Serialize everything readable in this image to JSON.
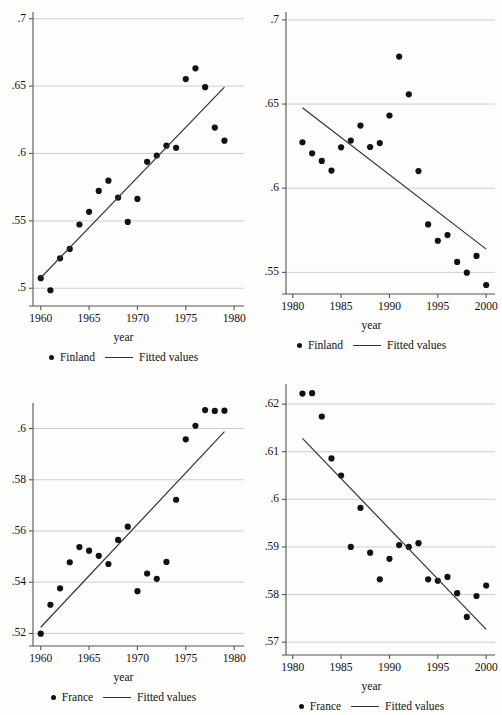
{
  "figure": {
    "background": "#fdfdfb",
    "marker_color": "#111111",
    "line_color": "#333333",
    "grid_color": "#c8c8c8",
    "axis_color": "#555555"
  },
  "panels": [
    {
      "id": "finland-1960-1979",
      "position": {
        "left": 0,
        "top": 0
      },
      "legend": {
        "series_label": "Finland",
        "fit_label": "Fitted values"
      },
      "chart_data": {
        "type": "scatter",
        "title": "",
        "xlabel": "year",
        "ylabel": "",
        "xlim": [
          1959.2,
          1980.4
        ],
        "ylim": [
          0.4935,
          0.7035
        ],
        "xticks": [
          1960,
          1965,
          1970,
          1975,
          1980
        ],
        "xticklabels": [
          "1960",
          "1965",
          "1970",
          "1975",
          "1980"
        ],
        "yticks": [
          0.5,
          0.55,
          0.6,
          0.65,
          0.7
        ],
        "yticklabels": [
          ".5",
          ".55",
          ".6",
          ".65",
          ".7"
        ],
        "grid": true,
        "legend_position": "below",
        "series": [
          {
            "name": "Finland",
            "kind": "scatter",
            "x": [
              1960,
              1961,
              1962,
              1963,
              1964,
              1965,
              1966,
              1967,
              1968,
              1969,
              1970,
              1971,
              1972,
              1973,
              1974,
              1975,
              1976,
              1977,
              1978,
              1979
            ],
            "y": [
              0.5075,
              0.4985,
              0.5222,
              0.5292,
              0.5473,
              0.5567,
              0.5722,
              0.5798,
              0.5673,
              0.5492,
              0.5663,
              0.5938,
              0.5985,
              0.6058,
              0.6042,
              0.6552,
              0.6632,
              0.6492,
              0.6192,
              0.6095
            ]
          },
          {
            "name": "Fitted values",
            "kind": "line",
            "x": [
              1960,
              1979
            ],
            "y": [
              0.5078,
              0.6492
            ]
          }
        ]
      }
    },
    {
      "id": "finland-1981-2000",
      "position": {
        "left": 248,
        "top": 0
      },
      "legend": {
        "series_label": "Finland",
        "fit_label": "Fitted values"
      },
      "chart_data": {
        "type": "scatter",
        "title": "",
        "xlabel": "year",
        "ylabel": "",
        "xlim": [
          1979.3,
          2000.5
        ],
        "ylim": [
          0.5425,
          0.7035
        ],
        "xticks": [
          1980,
          1985,
          1990,
          1995,
          2000
        ],
        "xticklabels": [
          "1980",
          "1985",
          "1990",
          "1995",
          "2000"
        ],
        "yticks": [
          0.55,
          0.6,
          0.65,
          0.7
        ],
        "yticklabels": [
          ".55",
          ".6",
          ".65",
          ".7"
        ],
        "grid": true,
        "legend_position": "below",
        "series": [
          {
            "name": "Finland",
            "kind": "scatter",
            "x": [
              1981,
              1982,
              1983,
              1984,
              1985,
              1986,
              1987,
              1988,
              1989,
              1990,
              1991,
              1992,
              1993,
              1994,
              1995,
              1996,
              1997,
              1998,
              1999,
              2000
            ],
            "y": [
              0.6273,
              0.6207,
              0.6162,
              0.6105,
              0.6243,
              0.6283,
              0.6372,
              0.6245,
              0.6268,
              0.6432,
              0.6782,
              0.6558,
              0.6102,
              0.5785,
              0.5688,
              0.5722,
              0.5562,
              0.5498,
              0.5598,
              0.5425
            ]
          },
          {
            "name": "Fitted values",
            "kind": "line",
            "x": [
              1981,
              2000
            ],
            "y": [
              0.6478,
              0.5638
            ]
          }
        ]
      }
    },
    {
      "id": "france-1960-1979",
      "position": {
        "left": 0,
        "top": 357
      },
      "legend": {
        "series_label": "France",
        "fit_label": "Fitted values"
      },
      "chart_data": {
        "type": "scatter",
        "title": "",
        "xlabel": "year",
        "ylabel": "",
        "xlim": [
          1959.2,
          1980.4
        ],
        "ylim": [
          0.5186,
          0.6092
        ],
        "xticks": [
          1960,
          1965,
          1970,
          1975,
          1980
        ],
        "xticklabels": [
          "1960",
          "1965",
          "1970",
          "1975",
          "1980"
        ],
        "yticks": [
          0.52,
          0.54,
          0.56,
          0.58,
          0.6
        ],
        "yticklabels": [
          ".52",
          ".54",
          ".56",
          ".58",
          ".6"
        ],
        "grid": true,
        "legend_position": "below",
        "series": [
          {
            "name": "France",
            "kind": "scatter",
            "x": [
              1960,
              1961,
              1962,
              1963,
              1964,
              1965,
              1966,
              1967,
              1968,
              1969,
              1970,
              1971,
              1972,
              1973,
              1974,
              1975,
              1976,
              1977,
              1978,
              1979
            ],
            "y": [
              0.5199,
              0.5312,
              0.5376,
              0.5478,
              0.5537,
              0.5523,
              0.5503,
              0.5471,
              0.5565,
              0.5617,
              0.5365,
              0.5434,
              0.5413,
              0.5479,
              0.5722,
              0.5958,
              0.6011,
              0.6072,
              0.6069,
              0.607
            ]
          },
          {
            "name": "Fitted values",
            "kind": "line",
            "x": [
              1960,
              1979
            ],
            "y": [
              0.5224,
              0.5988
            ]
          }
        ]
      }
    },
    {
      "id": "france-1981-2000",
      "position": {
        "left": 248,
        "top": 357
      },
      "legend": {
        "series_label": "France",
        "fit_label": "Fitted values"
      },
      "chart_data": {
        "type": "scatter",
        "title": "",
        "xlabel": "year",
        "ylabel": "",
        "xlim": [
          1979.3,
          2000.5
        ],
        "ylim": [
          0.5692,
          0.6238
        ],
        "xticks": [
          1980,
          1985,
          1990,
          1995,
          2000
        ],
        "xticklabels": [
          "1980",
          "1985",
          "1990",
          "1995",
          "2000"
        ],
        "yticks": [
          0.57,
          0.58,
          0.59,
          0.6,
          0.61,
          0.62
        ],
        "yticklabels": [
          ".57",
          ".58",
          ".59",
          ".6",
          ".61",
          ".62"
        ],
        "grid": true,
        "legend_position": "below",
        "series": [
          {
            "name": "France",
            "kind": "scatter",
            "x": [
              1981,
              1982,
              1983,
              1984,
              1985,
              1986,
              1987,
              1988,
              1989,
              1990,
              1991,
              1992,
              1993,
              1994,
              1995,
              1996,
              1997,
              1998,
              1999,
              2000
            ],
            "y": [
              0.6222,
              0.6223,
              0.6174,
              0.6086,
              0.605,
              0.59,
              0.5982,
              0.5888,
              0.5832,
              0.5875,
              0.5904,
              0.59,
              0.5908,
              0.5832,
              0.5829,
              0.5837,
              0.5803,
              0.5753,
              0.5797,
              0.5819
            ]
          },
          {
            "name": "Fitted values",
            "kind": "line",
            "x": [
              1981,
              2000
            ],
            "y": [
              0.6128,
              0.5727
            ]
          }
        ]
      }
    }
  ]
}
